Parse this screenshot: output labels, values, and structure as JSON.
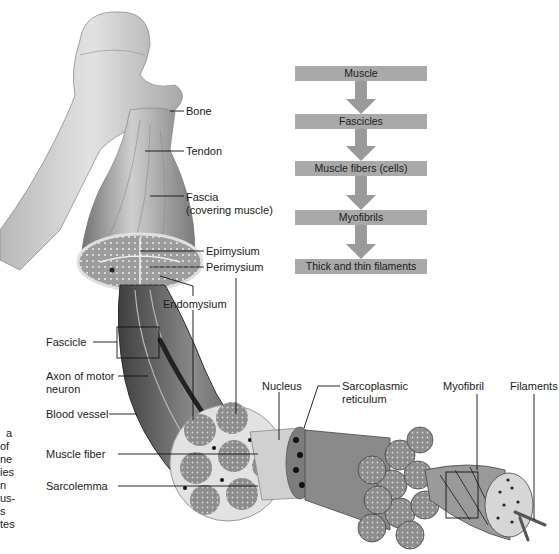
{
  "flowchart": {
    "steps": [
      {
        "label": "Muscle",
        "top": 66
      },
      {
        "label": "Fascicles",
        "top": 114
      },
      {
        "label": "Muscle fibers (cells)",
        "top": 161
      },
      {
        "label": "Myofibrils",
        "top": 210
      },
      {
        "label": "Thick and thin filaments",
        "top": 259
      }
    ],
    "box_color": "#a9a9a9",
    "arrow_color": "#9a9a9a"
  },
  "labels": {
    "bone": "Bone",
    "tendon": "Tendon",
    "fascia_line1": "Fascia",
    "fascia_line2": "(covering muscle)",
    "epimysium": "Epimysium",
    "perimysium": "Perimysium",
    "endomysium": "Endomysium",
    "fascicle": "Fascicle",
    "axon_line1": "Axon of motor",
    "axon_line2": "neuron",
    "blood_vessel": "Blood vessel",
    "muscle_fiber": "Muscle fiber",
    "sarcolemma": "Sarcolemma",
    "nucleus": "Nucleus",
    "sarcoplasmic_line1": "Sarcoplasmic",
    "sarcoplasmic_line2": "reticulum",
    "myofibril": "Myofibril",
    "filaments": "Filaments"
  },
  "margin_text": [
    "a",
    "of",
    "ne",
    "ies",
    "n",
    "us-",
    "s",
    "tes"
  ]
}
